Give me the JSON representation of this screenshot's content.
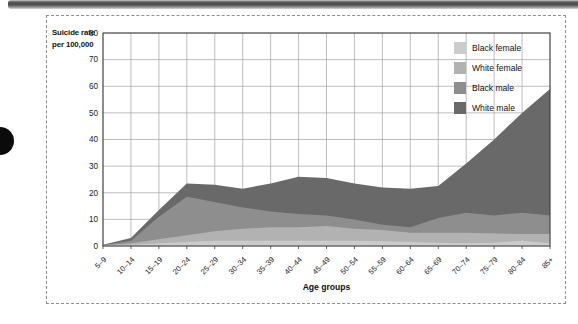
{
  "figure": {
    "ylabel_line1": "Suicide rate",
    "ylabel_line2": "per 100,000",
    "xlabel": "Age groups"
  },
  "colors": {
    "grid": "#a2a2a2",
    "frame": "#3c3c3c",
    "text": "#1c1c1c",
    "plot_background": "#ffffff"
  },
  "chart_data": {
    "type": "area",
    "stacked": false,
    "title": "",
    "xlabel": "Age groups",
    "ylabel": "Suicide rate per 100,000",
    "ylim": [
      0,
      80
    ],
    "yticks": [
      0,
      10,
      20,
      30,
      40,
      50,
      60,
      70,
      80
    ],
    "grid": true,
    "legend_position": "top-right-inside",
    "categories": [
      "5–9",
      "10–14",
      "15–19",
      "20–24",
      "25–29",
      "30–34",
      "35–39",
      "40–44",
      "45–49",
      "50–54",
      "55–59",
      "60–64",
      "65–69",
      "70–74",
      "75–79",
      "80–84",
      "85+"
    ],
    "series": [
      {
        "name": "Black female",
        "color": "#cbcbcb",
        "values": [
          0.2,
          0.5,
          1,
          1.5,
          2,
          2,
          2,
          2,
          2,
          2,
          1.8,
          1.5,
          1.2,
          1,
          1.2,
          2,
          1
        ]
      },
      {
        "name": "White female",
        "color": "#b2b2b2",
        "values": [
          0.3,
          1,
          2.5,
          4,
          5.5,
          6.5,
          7,
          7,
          7.5,
          6.5,
          6,
          5,
          5,
          5,
          4.7,
          4.5,
          4.5
        ]
      },
      {
        "name": "Black male",
        "color": "#8e8e8e",
        "values": [
          0.4,
          2,
          11,
          18.5,
          16.5,
          14.5,
          13,
          12,
          11.5,
          10,
          8,
          7,
          10.5,
          12.5,
          11.5,
          12.5,
          11.5
        ]
      },
      {
        "name": "White male",
        "color": "#696969",
        "values": [
          0.5,
          3,
          13.5,
          23.5,
          23,
          21.5,
          23.5,
          26,
          25.5,
          23.5,
          22,
          21.5,
          22.5,
          31,
          40,
          50,
          59
        ]
      }
    ]
  }
}
